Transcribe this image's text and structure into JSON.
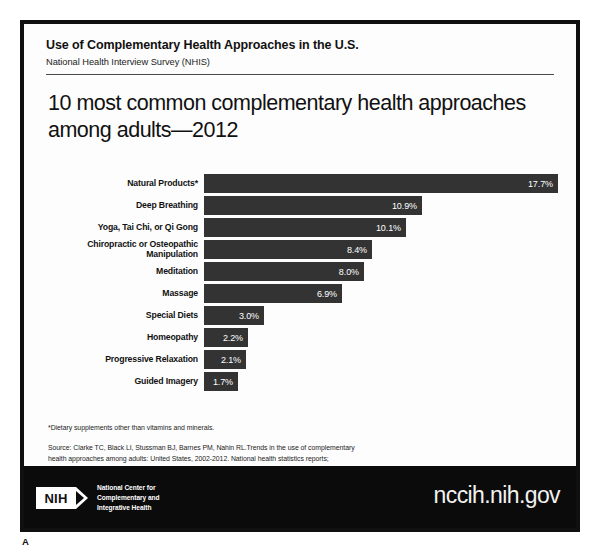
{
  "header": {
    "title": "Use of Complementary Health Approaches in the U.S.",
    "subtitle": "National Health Interview Survey (NHIS)"
  },
  "main": {
    "title": "10 most common complementary health approaches among adults—2012"
  },
  "chart_data": {
    "type": "bar",
    "orientation": "horizontal",
    "title": "10 most common complementary health approaches among adults—2012",
    "subtitle": "National Health Interview Survey (NHIS)",
    "xlabel": "",
    "ylabel": "",
    "xlim": [
      0,
      17.7
    ],
    "grid": false,
    "legend": "none",
    "bar_color": "#333333",
    "value_label_color": "#ffffff",
    "value_suffix": "%",
    "categories": [
      "Natural Products*",
      "Deep Breathing",
      "Yoga, Tai Chi, or Qi Gong",
      "Chiropractic or Osteopathic Manipulation",
      "Meditation",
      "Massage",
      "Special Diets",
      "Homeopathy",
      "Progressive Relaxation",
      "Guided Imagery"
    ],
    "values": [
      17.7,
      10.9,
      10.1,
      8.4,
      8.0,
      6.9,
      3.0,
      2.2,
      2.1,
      1.7
    ],
    "value_labels": [
      "17.7%",
      "10.9%",
      "10.1%",
      "8.4%",
      "8.0%",
      "6.9%",
      "3.0%",
      "2.2%",
      "2.1%",
      "1.7%"
    ],
    "bars": [
      {
        "label": "Natural Products*",
        "label_line2": "",
        "value": 17.7,
        "value_label": "17.7%"
      },
      {
        "label": "Deep Breathing",
        "label_line2": "",
        "value": 10.9,
        "value_label": "10.9%"
      },
      {
        "label": "Yoga, Tai Chi, or Qi Gong",
        "label_line2": "",
        "value": 10.1,
        "value_label": "10.1%"
      },
      {
        "label": "Chiropractic or Osteopathic",
        "label_line2": "Manipulation",
        "value": 8.4,
        "value_label": "8.4%"
      },
      {
        "label": "Meditation",
        "label_line2": "",
        "value": 8.0,
        "value_label": "8.0%"
      },
      {
        "label": "Massage",
        "label_line2": "",
        "value": 6.9,
        "value_label": "6.9%"
      },
      {
        "label": "Special Diets",
        "label_line2": "",
        "value": 3.0,
        "value_label": "3.0%"
      },
      {
        "label": "Homeopathy",
        "label_line2": "",
        "value": 2.2,
        "value_label": "2.2%"
      },
      {
        "label": "Progressive Relaxation",
        "label_line2": "",
        "value": 2.1,
        "value_label": "2.1%"
      },
      {
        "label": "Guided Imagery",
        "label_line2": "",
        "value": 1.7,
        "value_label": "1.7%"
      }
    ]
  },
  "notes": {
    "footnote": "*Dietary supplements other than vitamins and minerals.",
    "source_line1": "Source: Clarke TC, Black LI, Stussman BJ, Barnes PM, Nahin RL.Trends in the use of complementary",
    "source_line2": "health approaches among adults: United States, 2002-2012. National health statistics reports;",
    "source_line3": "no 79. Hyattsville, MD: National Center for Health Statistics. 2015."
  },
  "footer": {
    "agency": "U.S. Department of Health & Human Services • National Institutes of Health",
    "logo_mark": "NIH",
    "logo_line1": "National Center for",
    "logo_line2": "Complementary and",
    "logo_line3": "Integrative Health",
    "url": "nccih.nih.gov"
  },
  "panel_letter": "A"
}
